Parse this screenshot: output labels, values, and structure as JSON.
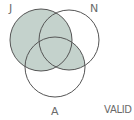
{
  "diagram": {
    "type": "venn",
    "sets": [
      {
        "id": "J",
        "label": "J"
      },
      {
        "id": "N",
        "label": "N"
      },
      {
        "id": "A",
        "label": "A"
      }
    ],
    "shaded_regions": [
      "J-only",
      "J∩N",
      "J∩A",
      "J∩N∩A",
      "N∩A"
    ],
    "shade_color": "#c4d2cc",
    "outline_color": "#555555",
    "verdict": "VALID"
  }
}
